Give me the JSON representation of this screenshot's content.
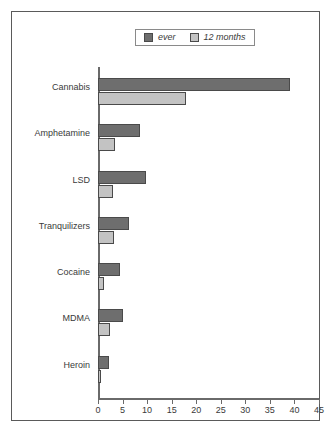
{
  "chart_data": {
    "type": "bar",
    "orientation": "horizontal",
    "title": "",
    "subtitle": "",
    "xlabel": "",
    "ylabel": "",
    "xlim": [
      0,
      45
    ],
    "xticks": [
      0,
      5,
      10,
      15,
      20,
      25,
      30,
      35,
      40,
      45
    ],
    "grid": false,
    "legend_position": "top",
    "categories": [
      "Cannabis",
      "Amphetamine",
      "LSD",
      "Tranquilizers",
      "Cocaine",
      "MDMA",
      "Heroin"
    ],
    "series": [
      {
        "name": "ever",
        "color": "#6e6e6e",
        "values": [
          39,
          8.6,
          9.8,
          6.3,
          4.5,
          5.0,
          2.2
        ]
      },
      {
        "name": "12 months",
        "color": "#c3c3c3",
        "values": [
          18,
          3.5,
          3.0,
          3.2,
          1.2,
          2.5,
          0.7
        ]
      }
    ]
  },
  "legend": {
    "items": [
      {
        "label": "ever",
        "swatch": "legend-swatch-ever"
      },
      {
        "label": "12 months",
        "swatch": "legend-swatch-12-months"
      }
    ]
  },
  "colors": {
    "ever": "#6e6e6e",
    "twelve_months": "#c3c3c3",
    "axis": "#6a6a6a",
    "frame": "#5a5a5a",
    "text": "#3a3a3a"
  }
}
